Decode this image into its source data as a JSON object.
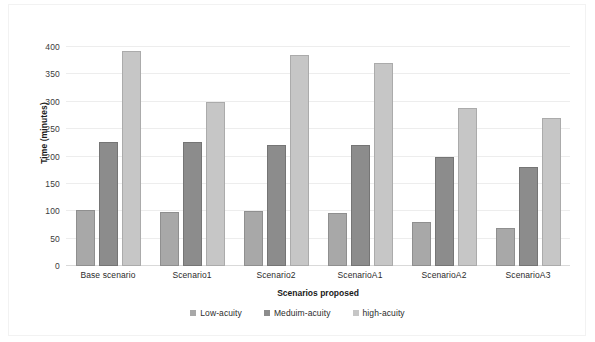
{
  "chart_data": {
    "type": "bar",
    "title": "",
    "xlabel": "Scenarios proposed",
    "ylabel": "Time (minutes)",
    "categories": [
      "Base scenario",
      "Scenario1",
      "Scenario2",
      "ScenarioA1",
      "ScenarioA2",
      "ScenarioA3"
    ],
    "series": [
      {
        "name": "Low-acuity",
        "color": "#a8a8a8",
        "values": [
          102,
          98,
          101,
          96,
          81,
          69
        ]
      },
      {
        "name": "Meduim-acuity",
        "color": "#8c8c8c",
        "values": [
          227,
          227,
          221,
          221,
          200,
          180
        ]
      },
      {
        "name": "high-acuity",
        "color": "#c6c6c6",
        "values": [
          392,
          300,
          385,
          370,
          289,
          270
        ]
      }
    ],
    "ylim": [
      0,
      400
    ],
    "yticks": [
      0,
      50,
      100,
      150,
      200,
      250,
      300,
      350,
      400
    ],
    "ytick_labels": [
      "0",
      "50",
      "100",
      "150",
      "200",
      "250",
      "300",
      "350",
      "400"
    ],
    "grid": true,
    "legend_position": "bottom"
  }
}
